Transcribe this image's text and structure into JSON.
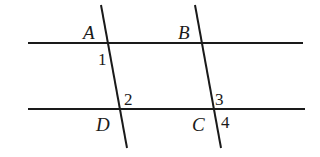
{
  "diagram": {
    "type": "parallel lines cut by two transversals",
    "stroke_color": "#1a1a1a",
    "background": "#ffffff",
    "lines": {
      "top_horizontal": {
        "x1": 28,
        "y1": 43,
        "x2": 303,
        "y2": 43
      },
      "bottom_horizontal": {
        "x1": 28,
        "y1": 109,
        "x2": 305,
        "y2": 109
      },
      "left_transversal": {
        "x1": 101,
        "y1": 5,
        "x2": 127,
        "y2": 148
      },
      "right_transversal": {
        "x1": 195,
        "y1": 5,
        "x2": 221,
        "y2": 148
      }
    },
    "points": {
      "A": "A",
      "B": "B",
      "C": "C",
      "D": "D"
    },
    "angles": {
      "1": "1",
      "2": "2",
      "3": "3",
      "4": "4"
    }
  }
}
